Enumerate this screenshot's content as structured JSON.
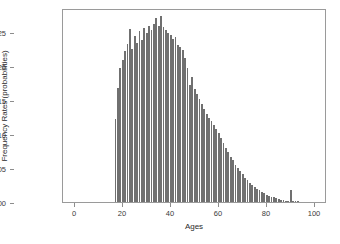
{
  "chart_data": {
    "type": "bar",
    "title": "",
    "xlabel": "Ages",
    "ylabel": "Frequency Rates (probabilities)",
    "xlim": [
      -5,
      105
    ],
    "ylim": [
      0,
      0.0285
    ],
    "grid": false,
    "legend": null,
    "bar_color": "#707070",
    "frame_color": "#9a9a9a",
    "background": "#ffffff",
    "xticks": [
      0,
      20,
      40,
      60,
      80,
      100
    ],
    "xtick_labels": [
      "0",
      "20",
      "40",
      "60",
      "80",
      "100"
    ],
    "yticks": [
      0.0,
      0.005,
      0.01,
      0.015,
      0.02,
      0.025
    ],
    "ytick_labels": [
      "0.000",
      "0.005",
      "0.010",
      "0.015",
      "0.020",
      "0.025"
    ],
    "categories": [
      17,
      18,
      19,
      20,
      21,
      22,
      23,
      24,
      25,
      26,
      27,
      28,
      29,
      30,
      31,
      32,
      33,
      34,
      35,
      36,
      37,
      38,
      39,
      40,
      41,
      42,
      43,
      44,
      45,
      46,
      47,
      48,
      49,
      50,
      51,
      52,
      53,
      54,
      55,
      56,
      57,
      58,
      59,
      60,
      61,
      62,
      63,
      64,
      65,
      66,
      67,
      68,
      69,
      70,
      71,
      72,
      73,
      74,
      75,
      76,
      77,
      78,
      79,
      80,
      81,
      82,
      83,
      84,
      85,
      86,
      87,
      88,
      89,
      90,
      91,
      92,
      93,
      94,
      95,
      96,
      97,
      98
    ],
    "values": [
      0.0122,
      0.0168,
      0.0197,
      0.0209,
      0.0222,
      0.0232,
      0.0254,
      0.0225,
      0.0244,
      0.0233,
      0.0251,
      0.0238,
      0.0256,
      0.0249,
      0.0259,
      0.0253,
      0.0262,
      0.0271,
      0.0258,
      0.0274,
      0.0257,
      0.0253,
      0.0248,
      0.0246,
      0.0239,
      0.0242,
      0.0231,
      0.0228,
      0.0224,
      0.0211,
      0.0197,
      0.0172,
      0.0183,
      0.0166,
      0.0158,
      0.0151,
      0.0144,
      0.0137,
      0.0129,
      0.0124,
      0.0119,
      0.0113,
      0.0107,
      0.0102,
      0.0094,
      0.0087,
      0.0079,
      0.0073,
      0.0066,
      0.0061,
      0.0055,
      0.005,
      0.0046,
      0.0041,
      0.0036,
      0.0032,
      0.0028,
      0.0025,
      0.0022,
      0.0019,
      0.0017,
      0.0015,
      0.0013,
      0.0011,
      0.0009,
      0.0008,
      0.0007,
      0.0006,
      0.0004,
      0.0003,
      0.0003,
      0.0002,
      0.0002,
      0.0017,
      0.0001,
      0.0001,
      0.0001,
      0.0,
      0.0,
      0.0,
      0.0,
      0.0
    ]
  }
}
